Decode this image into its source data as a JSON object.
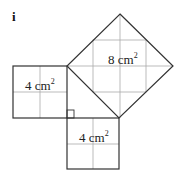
{
  "part_label": "i",
  "squares": [
    {
      "name": "left",
      "area_value": "4 cm",
      "exponent": "2"
    },
    {
      "name": "bottom",
      "area_value": "4 cm",
      "exponent": "2"
    },
    {
      "name": "hypotenuse",
      "area_value": "8 cm",
      "exponent": "2"
    }
  ],
  "colors": {
    "outline": "#333333",
    "grid": "#aaaaaa"
  }
}
